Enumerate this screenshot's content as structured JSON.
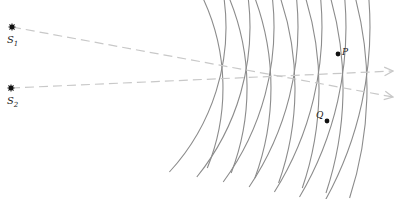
{
  "diagram": {
    "colors": {
      "wavefront": "#8c8c8c",
      "ray": "#c8c8c8",
      "point": "#111111",
      "label": "#222222"
    },
    "sources": [
      {
        "id": "S1",
        "label": "S",
        "sub": "1",
        "x": 12,
        "y": 27
      },
      {
        "id": "S2",
        "label": "S",
        "sub": "2",
        "x": 11,
        "y": 88
      }
    ],
    "wavefront_radii": [
      214,
      238,
      262,
      286,
      310,
      334,
      358
    ],
    "rays": [
      {
        "from": "S1",
        "x1": 12,
        "y1": 27,
        "x2": 393,
        "y2": 97
      },
      {
        "from": "S2",
        "x1": 11,
        "y1": 88,
        "x2": 393,
        "y2": 71
      }
    ],
    "points": [
      {
        "id": "P",
        "label": "P",
        "x": 338,
        "y": 54
      },
      {
        "id": "Q",
        "label": "Q",
        "x": 327,
        "y": 121
      }
    ]
  }
}
